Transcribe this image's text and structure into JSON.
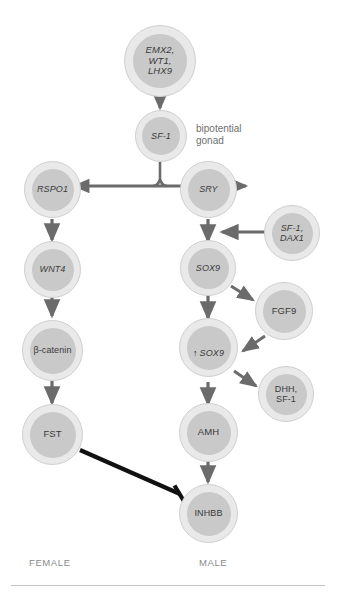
{
  "figure": {
    "background": "#ffffff",
    "node_fill": "#e9e9e9",
    "node_inner_fill": "#c9c9c9",
    "node_stroke": "#cfcfcf",
    "arrow_color": "#6b6b6b",
    "inhibit_color": "#111111",
    "text_color": "#3a3a3a",
    "annotation_color": "#6f6f6f",
    "axis_label_color": "#8a8a8a"
  },
  "nodes": {
    "progenitor": {
      "label": "EMX2,\nWT1,\nLHX9",
      "italic": true
    },
    "sf1": {
      "label": "SF-1",
      "italic": true
    },
    "rspo1": {
      "label": "RSPO1",
      "italic": true
    },
    "wnt4": {
      "label": "WNT4",
      "italic": true
    },
    "bcatenin": {
      "label": "β-catenin",
      "italic": false
    },
    "fst": {
      "label": "FST",
      "italic": false
    },
    "sry": {
      "label": "SRY",
      "italic": true
    },
    "sf1_dax1": {
      "label": "SF-1,\nDAX1",
      "italic": true
    },
    "sox9": {
      "label": "SOX9",
      "italic": true
    },
    "fgf9": {
      "label": "FGF9",
      "italic": false
    },
    "sox9_up": {
      "arrow": "↑",
      "label": "SOX9",
      "italic": true
    },
    "dhh_sf1": {
      "label": "DHH,\nSF-1",
      "italic": false
    },
    "amh": {
      "label": "AMH",
      "italic": false
    },
    "inhbb": {
      "label": "INHBB",
      "italic": false
    }
  },
  "annotations": {
    "bipotential_gonad": "bipotential\ngonad"
  },
  "axis_labels": {
    "female": "FEMALE",
    "male": "MALE"
  }
}
